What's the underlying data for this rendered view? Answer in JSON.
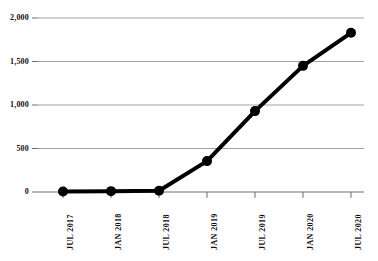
{
  "chart_data": {
    "type": "line",
    "title": "",
    "subtitle": "",
    "xlabel": "",
    "ylabel": "",
    "categories": [
      "JUL 2017",
      "JAN 2018",
      "JUL 2018",
      "JAN 2019",
      "JUL 2019",
      "JAN 2020",
      "JUL 2020"
    ],
    "values": [
      5,
      10,
      15,
      355,
      930,
      1450,
      1830
    ],
    "series": [
      {
        "name": "",
        "values": [
          5,
          10,
          15,
          355,
          930,
          1450,
          1830
        ]
      }
    ],
    "ylim": [
      0,
      2000
    ],
    "ytick_values": [
      0,
      500,
      1000,
      1500,
      2000
    ],
    "ytick_labels": [
      "0",
      "500",
      "1,000",
      "1,500",
      "2,000"
    ],
    "xtick_labels": [
      "JUL 2017",
      "JAN 2018",
      "JUL 2018",
      "JAN 2019",
      "JUL 2019",
      "JAN 2020",
      "JUL 2020"
    ],
    "grid": true,
    "grid_axis": "y",
    "legend": false,
    "legend_position": "none",
    "annotations": [],
    "style": {
      "line_color": "#000000",
      "marker_color": "#000000",
      "grid_color": "#8a8a8a",
      "axis_color": "#6f6f6f",
      "background": "#ffffff",
      "line_width": 4,
      "marker_radius": 5
    }
  },
  "axes": {
    "x_tick_positions_px": [
      63,
      111,
      159,
      207,
      255,
      303,
      351
    ],
    "y_tick_positions_px": [
      192,
      157,
      122,
      87,
      53,
      18
    ],
    "plot_left_px": 38,
    "plot_right_px": 364,
    "plot_top_px": 18,
    "plot_bottom_px": 192
  }
}
